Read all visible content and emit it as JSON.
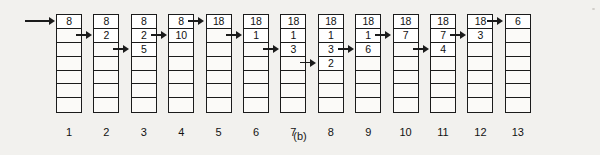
{
  "figure": {
    "caption": "(b)",
    "cells_per_stack": 7,
    "colors": {
      "background": "#f2f1ee",
      "ink": "#1b1b1b",
      "cell_fill": "#ffffff"
    },
    "stacks": [
      {
        "label": "1",
        "values": [
          "8"
        ],
        "arrow_row": 1,
        "arrow_long": true
      },
      {
        "label": "2",
        "values": [
          "8",
          "2"
        ],
        "arrow_row": 2,
        "arrow_long": false
      },
      {
        "label": "3",
        "values": [
          "8",
          "2",
          "5"
        ],
        "arrow_row": 3,
        "arrow_long": false
      },
      {
        "label": "4",
        "values": [
          "8",
          "10"
        ],
        "arrow_row": 2,
        "arrow_long": false
      },
      {
        "label": "5",
        "values": [
          "18"
        ],
        "arrow_row": 1,
        "arrow_long": false
      },
      {
        "label": "6",
        "values": [
          "18",
          "1"
        ],
        "arrow_row": 2,
        "arrow_long": false
      },
      {
        "label": "7",
        "values": [
          "18",
          "1",
          "3"
        ],
        "arrow_row": 3,
        "arrow_long": false
      },
      {
        "label": "8",
        "values": [
          "18",
          "1",
          "3",
          "2"
        ],
        "arrow_row": 4,
        "arrow_long": false
      },
      {
        "label": "9",
        "values": [
          "18",
          "1",
          "6"
        ],
        "arrow_row": 3,
        "arrow_long": false
      },
      {
        "label": "10",
        "values": [
          "18",
          "7"
        ],
        "arrow_row": 2,
        "arrow_long": false
      },
      {
        "label": "11",
        "values": [
          "18",
          "7",
          "4"
        ],
        "arrow_row": 3,
        "arrow_long": false
      },
      {
        "label": "12",
        "values": [
          "18",
          "3"
        ],
        "arrow_row": 2,
        "arrow_long": false
      },
      {
        "label": "13",
        "values": [
          "6"
        ],
        "arrow_row": 1,
        "arrow_long": false
      }
    ]
  }
}
